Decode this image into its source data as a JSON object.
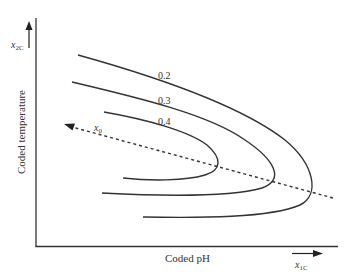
{
  "diagram": {
    "type": "contour-plot",
    "y_axis": {
      "label": "Coded temperature",
      "variable": "x",
      "variable_sub": "2C"
    },
    "x_axis": {
      "label": "Coded pH",
      "variable": "x",
      "variable_sub": "1C"
    },
    "contours": [
      {
        "label": "0.2"
      },
      {
        "label": "0.3"
      },
      {
        "label": "0.4"
      }
    ],
    "path_line": {
      "label": "x",
      "label_sub": "0",
      "style": "dashed"
    },
    "colors": {
      "line": "#333333",
      "background": "#ffffff"
    }
  }
}
